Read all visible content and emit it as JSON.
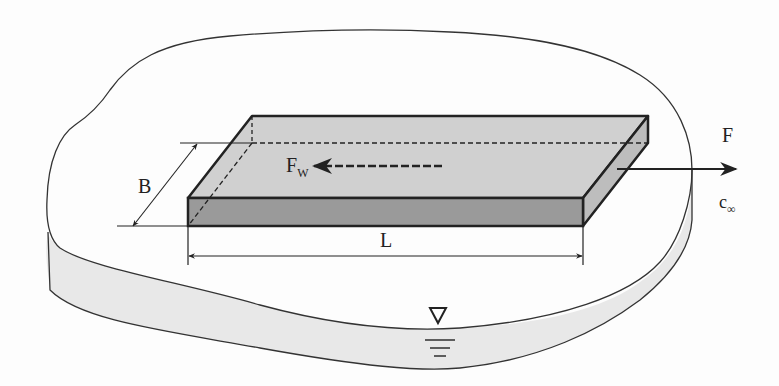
{
  "figure": {
    "labels": {
      "width": "B",
      "length": "L",
      "wall_force": "F",
      "wall_force_sub": "W",
      "pull_force": "F",
      "velocity": "c",
      "velocity_sub": "∞"
    },
    "symbols": [
      "water-level-symbol"
    ],
    "colors": {
      "plate_top": "#d0d0d0",
      "plate_front": "#9a9a9a",
      "plate_side": "#bdbdbd",
      "water_edge": "#e8e8e8",
      "line": "#222222"
    }
  }
}
